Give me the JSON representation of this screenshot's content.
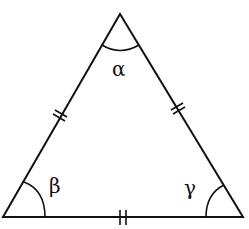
{
  "diagram": {
    "vertices": {
      "top": [
        120,
        14
      ],
      "bottom_left": [
        3,
        217
      ],
      "bottom_right": [
        243,
        217
      ]
    },
    "angles": [
      {
        "id": "alpha",
        "label": "α",
        "vertex": "top"
      },
      {
        "id": "beta",
        "label": "β",
        "vertex": "bottom_left"
      },
      {
        "id": "gamma",
        "label": "γ",
        "vertex": "bottom_right"
      }
    ],
    "sides": [
      {
        "id": "left",
        "tick_marks": 2
      },
      {
        "id": "right",
        "tick_marks": 2
      },
      {
        "id": "bottom",
        "tick_marks": 2
      }
    ],
    "stroke_color": "#111111",
    "background_color": "#ffffff"
  }
}
